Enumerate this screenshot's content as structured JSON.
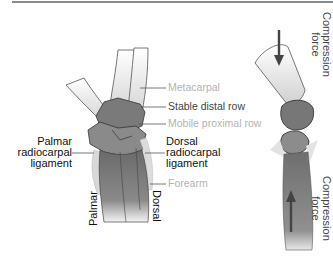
{
  "diagram": {
    "left_figure": {
      "labels": {
        "metacarpal": "Metacarpal",
        "stable_distal_row": "Stable distal row",
        "mobile_proximal_row": "Mobile proximal row",
        "dorsal_ligament_l1": "Dorsal",
        "dorsal_ligament_l2": "radiocarpal",
        "dorsal_ligament_l3": "ligament",
        "palmar_ligament_l1": "Palmar",
        "palmar_ligament_l2": "radiocarpal",
        "palmar_ligament_l3": "ligament",
        "forearm": "Forearm",
        "palmar_side": "Palmar",
        "dorsal_side": "Dorsal"
      }
    },
    "right_figure": {
      "labels": {
        "top_force_l1": "Compression",
        "top_force_l2": "force",
        "bottom_force_l1": "Compression",
        "bottom_force_l2": "force"
      }
    },
    "colors": {
      "bone_light": "#e6e6e6",
      "bone_dark": "#707070",
      "forearm": "#6a6a6a",
      "ligament": "#d8d8d8",
      "arrow": "#444444",
      "label_gray": "#b3b3b3",
      "label_dark": "#444444"
    }
  }
}
